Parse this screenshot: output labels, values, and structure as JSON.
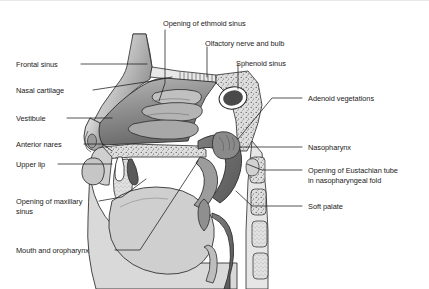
{
  "figure": {
    "type": "anatomical-illustration",
    "style": "grayscale line drawing with stippled bone",
    "background_color": "#ffffff",
    "line_color": "#1b1b1b",
    "tissue_fill": "#9a9a9a",
    "bone_fill": "#d8d8d8",
    "cavity_fill": "#6f6f6f"
  },
  "labels": {
    "left": [
      {
        "id": "frontal-sinus",
        "text": "Frontal sinus"
      },
      {
        "id": "nasal-cartilage",
        "text": "Nasal cartilage"
      },
      {
        "id": "vestibule",
        "text": "Vestibule"
      },
      {
        "id": "anterior-nares",
        "text": "Anterior nares"
      },
      {
        "id": "upper-lip",
        "text": "Upper lip"
      },
      {
        "id": "opening-of-maxillary-sinus-line1",
        "text": "Opening of maxillary"
      },
      {
        "id": "opening-of-maxillary-sinus-line2",
        "text": "sinus"
      },
      {
        "id": "mouth-and-oropharynx",
        "text": "Mouth and oropharynx"
      }
    ],
    "top": [
      {
        "id": "opening-of-ethmoid-sinus",
        "text": "Opening of ethmoid sinus"
      },
      {
        "id": "olfactory-nerve-and-bulb",
        "text": "Olfactory nerve and bulb"
      },
      {
        "id": "sphenoid-sinus",
        "text": "Sphenoid sinus"
      }
    ],
    "right": [
      {
        "id": "adenoid-vegetations",
        "text": "Adenoid vegetations"
      },
      {
        "id": "nasopharynx",
        "text": "Nasopharynx"
      },
      {
        "id": "opening-of-eustachian-tube-line1",
        "text": "Opening of Eustachian tube"
      },
      {
        "id": "opening-of-eustachian-tube-line2",
        "text": "in nasopharyngeal fold"
      },
      {
        "id": "soft-palate",
        "text": "Soft palate"
      }
    ]
  }
}
